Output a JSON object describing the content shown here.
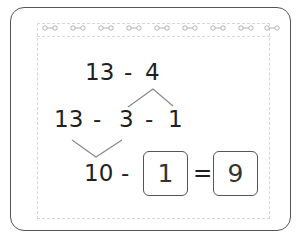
{
  "header": {
    "ring_icon": "dumbbell-ring-icon",
    "ring_count": 9
  },
  "problem": {
    "row1": {
      "a": "13",
      "op": "-",
      "b": "4"
    },
    "row2": {
      "a": "13",
      "op1": "-",
      "b": "3",
      "op2": "-",
      "c": "1"
    },
    "row3": {
      "a": "10",
      "op": "-",
      "box1": "1",
      "eq": "=",
      "box2": "9"
    }
  },
  "colors": {
    "text": "#1f1f1f",
    "border": "#555555",
    "bracket": "#888888",
    "dashed": "#d6d6d6"
  }
}
